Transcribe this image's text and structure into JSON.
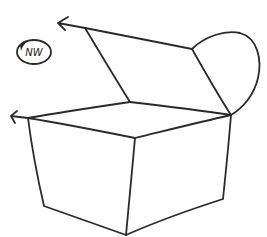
{
  "diagram": {
    "stroke_color": "#2a2a2a",
    "background": "#ffffff",
    "compass_label": "NW",
    "parts": [
      {
        "name": "lid-left-flap",
        "points": [
          [
            85,
            28
          ],
          [
            192,
            49
          ],
          [
            130,
            102
          ]
        ]
      },
      {
        "name": "lid-rounded-flap",
        "points": [
          [
            192,
            49
          ],
          [
            231,
            115
          ]
        ]
      },
      {
        "name": "box-top-back-left-edge",
        "points": [
          [
            28,
            118
          ],
          [
            130,
            102
          ]
        ]
      },
      {
        "name": "box-top-back-right-edge",
        "points": [
          [
            130,
            102
          ],
          [
            231,
            115
          ]
        ]
      },
      {
        "name": "box-top-front-left-edge",
        "points": [
          [
            28,
            118
          ],
          [
            135,
            138
          ]
        ]
      },
      {
        "name": "box-top-front-right-edge",
        "points": [
          [
            135,
            138
          ],
          [
            231,
            115
          ]
        ]
      },
      {
        "name": "box-left-face",
        "points": [
          [
            28,
            118
          ],
          [
            44,
            206
          ],
          [
            126,
            235
          ],
          [
            135,
            138
          ]
        ]
      },
      {
        "name": "box-right-face",
        "points": [
          [
            135,
            138
          ],
          [
            126,
            235
          ],
          [
            223,
            199
          ],
          [
            231,
            115
          ]
        ]
      }
    ],
    "arrows": [
      {
        "name": "arrow-top-left",
        "from": [
          85,
          28
        ],
        "to": [
          57,
          22
        ]
      },
      {
        "name": "arrow-mid-left",
        "from": [
          28,
          118
        ],
        "to": [
          10,
          115
        ]
      }
    ]
  }
}
